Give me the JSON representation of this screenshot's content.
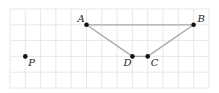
{
  "diagram": {
    "grid": {
      "cols": 13,
      "rows": 5,
      "line_color": "#e2e2e2"
    },
    "points": [
      {
        "id": "A",
        "label": "A",
        "col": 5,
        "row": 1,
        "label_pos": "upper-left"
      },
      {
        "id": "B",
        "label": "B",
        "col": 12,
        "row": 1,
        "label_pos": "upper-right"
      },
      {
        "id": "C",
        "label": "C",
        "col": 9,
        "row": 3,
        "label_pos": "lower-right"
      },
      {
        "id": "D",
        "label": "D",
        "col": 8,
        "row": 3,
        "label_pos": "lower-left"
      },
      {
        "id": "P",
        "label": "P",
        "col": 1,
        "row": 3,
        "label_pos": "lower-right"
      }
    ],
    "segments": [
      [
        "A",
        "B"
      ],
      [
        "B",
        "C"
      ],
      [
        "C",
        "D"
      ],
      [
        "D",
        "A"
      ]
    ],
    "segment_color": "#a8a8a8",
    "point_color": "#111111"
  }
}
